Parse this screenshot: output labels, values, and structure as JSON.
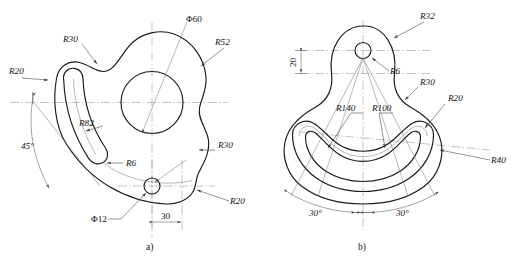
{
  "drawing": {
    "title_hidden": "",
    "background_color": "#ffffff",
    "line_color": "#1a1a1a",
    "thin_line_color": "#6e6e6e",
    "center_line_color": "#8a8a8a",
    "width": 514,
    "height": 265
  },
  "figure_a": {
    "caption": "a)",
    "labels": {
      "r30_top_left": "R30",
      "r20_left": "R20",
      "dia60": "Φ60",
      "r52": "R52",
      "r82": "R82",
      "angle_45": "45°",
      "r6": "R6",
      "r30_right": "R30",
      "r20_bottom_right": "R20",
      "dia12": "Φ12",
      "dim_30": "30"
    }
  },
  "figure_b": {
    "caption": "b)",
    "labels": {
      "r32": "R32",
      "r6": "R6",
      "dim_20": "20",
      "r30": "R30",
      "r20": "R20",
      "r140": "R140",
      "r100": "R100",
      "r40": "R40",
      "angle_left_30": "30°",
      "angle_right_30": "30°"
    }
  }
}
